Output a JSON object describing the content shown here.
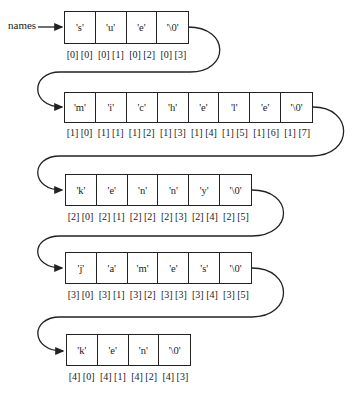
{
  "variable_label": "names",
  "rows": [
    {
      "cells": [
        "'s'",
        "'u'",
        "'e'",
        "'\\0'"
      ],
      "indices": [
        "[0] [0]",
        "[0] [1]",
        "[0] [2]",
        "[0] [3]"
      ]
    },
    {
      "cells": [
        "'m'",
        "'i'",
        "'c'",
        "'h'",
        "'e'",
        "'l'",
        "'e'",
        "'\\0'"
      ],
      "indices": [
        "[1] [0]",
        "[1] [1]",
        "[1] [2]",
        "[1] [3]",
        "[1] [4]",
        "[1] [5]",
        "[1] [6]",
        "[1] [7]"
      ]
    },
    {
      "cells": [
        "'k'",
        "'e'",
        "'n'",
        "'n'",
        "'y'",
        "'\\0'"
      ],
      "indices": [
        "[2] [0]",
        "[2] [1]",
        "[2] [2]",
        "[2] [3]",
        "[2] [4]",
        "[2] [5]"
      ]
    },
    {
      "cells": [
        "'j'",
        "'a'",
        "'m'",
        "'e'",
        "'s'",
        "'\\0'"
      ],
      "indices": [
        "[3] [0]",
        "[3] [1]",
        "[3] [2]",
        "[3] [3]",
        "[3] [4]",
        "[3] [5]"
      ]
    },
    {
      "cells": [
        "'k'",
        "'e'",
        "'n'",
        "'\\0'"
      ],
      "indices": [
        "[4] [0]",
        "[4] [1]",
        "[4] [2]",
        "[4] [3]"
      ]
    }
  ]
}
